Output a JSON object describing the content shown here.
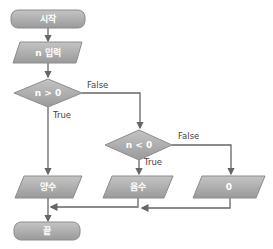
{
  "flowchart": {
    "nodes": {
      "start": {
        "type": "terminal",
        "label": "시작"
      },
      "input": {
        "type": "io",
        "label": "n 입력"
      },
      "cond1": {
        "type": "decision",
        "label": "n > 0"
      },
      "cond2": {
        "type": "decision",
        "label": "n < 0"
      },
      "positive": {
        "type": "io",
        "label": "양수"
      },
      "negative": {
        "type": "io",
        "label": "음수"
      },
      "zero": {
        "type": "io",
        "label": "0"
      },
      "end": {
        "type": "terminal",
        "label": "끝"
      }
    },
    "edges": {
      "cond1_false": "False",
      "cond1_true": "True",
      "cond2_false": "False",
      "cond2_true": "True"
    },
    "colors": {
      "shape_fill": "#a8a8a8",
      "shape_stroke": "#8c8c8c",
      "line": "#666666"
    }
  }
}
